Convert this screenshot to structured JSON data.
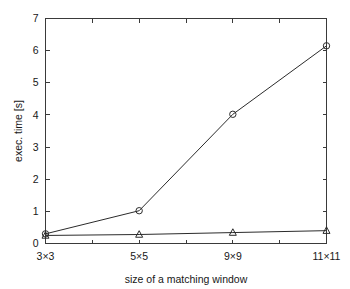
{
  "chart_data": {
    "type": "line",
    "title": "",
    "xlabel": "size of a matching window",
    "ylabel": "exec. time [s]",
    "categories": [
      "3×3",
      "5×5",
      "9×9",
      "11×11"
    ],
    "ylim": [
      0,
      7
    ],
    "yticks": [
      0,
      1,
      2,
      3,
      4,
      5,
      6,
      7
    ],
    "ytick_labels": [
      "0",
      "1",
      "2",
      "3",
      "4",
      "5",
      "6",
      "7"
    ],
    "xtick_labels": [
      "3×3",
      "5×5",
      "9×9",
      "11×11"
    ],
    "grid": false,
    "legend": "none",
    "series": [
      {
        "name": "circle-series",
        "marker": "circle",
        "color": "#2b2b2b",
        "values": [
          0.3,
          1.02,
          4.02,
          6.15
        ]
      },
      {
        "name": "triangle-series",
        "marker": "triangle",
        "color": "#2b2b2b",
        "values": [
          0.25,
          0.28,
          0.34,
          0.4
        ]
      }
    ]
  },
  "axes": {
    "y_label": "exec. time [s]",
    "x_label": "size of a matching window"
  }
}
